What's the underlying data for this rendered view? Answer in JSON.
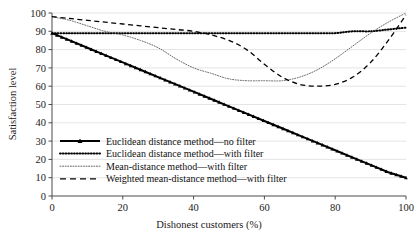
{
  "chart_data": {
    "type": "line",
    "title": "",
    "xlabel": "Dishonest customers (%)",
    "ylabel": "Satisfaction level",
    "xlim": [
      0,
      100
    ],
    "ylim": [
      0,
      100
    ],
    "xticks": [
      0,
      20,
      40,
      60,
      80,
      100
    ],
    "yticks": [
      0,
      10,
      20,
      30,
      40,
      50,
      60,
      70,
      80,
      90,
      100
    ],
    "grid": "horizontal",
    "legend_position": "lower-left-inside",
    "x": [
      0,
      5,
      10,
      15,
      20,
      25,
      30,
      35,
      40,
      45,
      50,
      55,
      60,
      65,
      70,
      75,
      80,
      85,
      90,
      95,
      100
    ],
    "series": [
      {
        "name": "Euclidean distance method—no filter",
        "style": "solid-with-markers",
        "color": "#000000",
        "values": [
          89,
          85,
          81,
          77,
          73,
          69,
          65,
          61,
          57,
          53,
          49,
          45,
          41,
          37,
          33,
          29,
          25,
          21,
          17,
          13,
          10
        ]
      },
      {
        "name": "Euclidean distance method—with filter",
        "style": "dotted-thick",
        "color": "#000000",
        "values": [
          89,
          89,
          89,
          89,
          89,
          89,
          89,
          89,
          89,
          89,
          89,
          89,
          89,
          89,
          89,
          89,
          89,
          90,
          90,
          91,
          92
        ]
      },
      {
        "name": "Mean-distance method—with filter",
        "style": "dotted-fine",
        "color": "#555555",
        "values": [
          98,
          96,
          93,
          90,
          88,
          85,
          81,
          75,
          70,
          67,
          64,
          63,
          63,
          63,
          65,
          69,
          75,
          82,
          89,
          95,
          100
        ]
      },
      {
        "name": "Weighted mean-distance method—with filter",
        "style": "dashed",
        "color": "#000000",
        "values": [
          98,
          97,
          96,
          95,
          94,
          93,
          92,
          91,
          90,
          88,
          85,
          80,
          72,
          65,
          61,
          60,
          61,
          65,
          73,
          85,
          99
        ]
      }
    ]
  },
  "axes": {
    "xlabel": "Dishonest customers (%)",
    "ylabel": "Satisfaction level",
    "xticks": [
      "0",
      "20",
      "40",
      "60",
      "80",
      "100"
    ],
    "yticks": [
      "0",
      "10",
      "20",
      "30",
      "40",
      "50",
      "60",
      "70",
      "80",
      "90",
      "100"
    ]
  },
  "legend": {
    "items": [
      {
        "label": "Euclidean distance method—no filter",
        "style": "solid-with-markers"
      },
      {
        "label": "Euclidean distance method—with filter",
        "style": "dotted-thick"
      },
      {
        "label": "Mean-distance method—with filter",
        "style": "dotted-fine"
      },
      {
        "label": "Weighted mean-distance method—with filter",
        "style": "dashed"
      }
    ]
  },
  "colors": {
    "background": "#ffffff",
    "axis": "#4a4a4a",
    "gridline": "#d9d9d9",
    "text": "#1a1a1a",
    "series_primary": "#000000",
    "series_mean": "#555555"
  }
}
